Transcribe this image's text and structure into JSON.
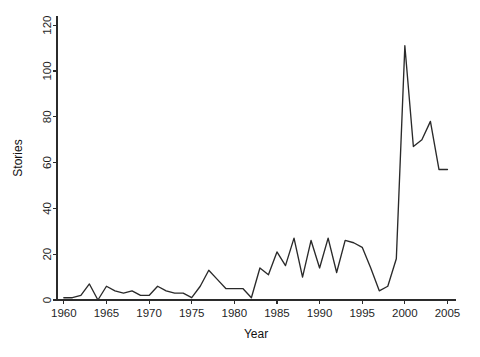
{
  "chart_data": {
    "type": "line",
    "title": "",
    "xlabel": "Year",
    "ylabel": "Stories",
    "xlim": [
      1959.2,
      2006.0
    ],
    "ylim": [
      0,
      124
    ],
    "xticks": [
      1960,
      1965,
      1970,
      1975,
      1980,
      1985,
      1990,
      1995,
      2000,
      2005
    ],
    "yticks": [
      0,
      20,
      40,
      60,
      80,
      100,
      120
    ],
    "xtick_labels": [
      "1960",
      "1965",
      "1970",
      "1975",
      "1980",
      "1985",
      "1990",
      "1995",
      "2000",
      "2005"
    ],
    "ytick_labels": [
      "0",
      "20",
      "40",
      "60",
      "80",
      "100",
      "120"
    ],
    "grid": false,
    "legend": false,
    "legend_position": "none",
    "line_color": "#2a2a2a",
    "axis_color": "#2b2b2b",
    "background_color": "#ffffff",
    "series": [
      {
        "name": "Stories",
        "x": [
          1960,
          1961,
          1962,
          1963,
          1964,
          1965,
          1966,
          1967,
          1968,
          1969,
          1970,
          1971,
          1972,
          1973,
          1974,
          1975,
          1976,
          1977,
          1978,
          1979,
          1980,
          1981,
          1982,
          1983,
          1984,
          1985,
          1986,
          1987,
          1988,
          1989,
          1990,
          1991,
          1992,
          1993,
          1994,
          1995,
          1996,
          1997,
          1998,
          1999,
          2000,
          2001,
          2002,
          2003,
          2004,
          2005
        ],
        "values": [
          1,
          1,
          2,
          7,
          0,
          6,
          4,
          3,
          4,
          2,
          2,
          6,
          4,
          3,
          3,
          1,
          6,
          13,
          9,
          5,
          5,
          5,
          1,
          14,
          11,
          21,
          15,
          27,
          10,
          26,
          14,
          27,
          12,
          26,
          25,
          23,
          14,
          4,
          6,
          18,
          111,
          67,
          70,
          78,
          57,
          57
        ]
      }
    ]
  },
  "axes": {
    "y_label": "Stories",
    "x_label": "Year"
  }
}
